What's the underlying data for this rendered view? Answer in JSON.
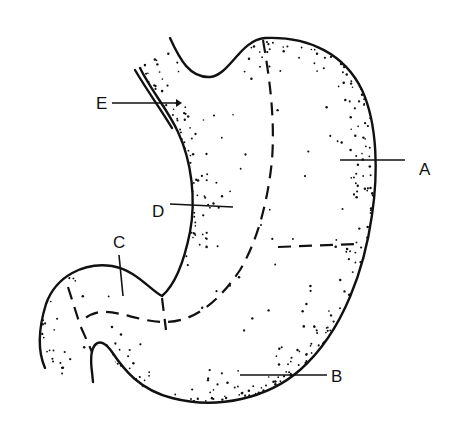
{
  "figure": {
    "labels": [
      {
        "id": "A",
        "text": "A",
        "x": 421,
        "y": 174,
        "lx1": 340,
        "ly1": 160,
        "lx2": 405,
        "ly2": 160
      },
      {
        "id": "B",
        "text": "B",
        "x": 332,
        "y": 382,
        "lx1": 240,
        "ly1": 375,
        "lx2": 327,
        "ly2": 375
      },
      {
        "id": "C",
        "text": "C",
        "x": 114,
        "y": 248,
        "lx1": 121,
        "ly1": 258,
        "lx2": 124,
        "ly2": 296
      },
      {
        "id": "D",
        "text": "D",
        "x": 153,
        "y": 217,
        "lx1": 168,
        "ly1": 203,
        "lx2": 232,
        "ly2": 206
      },
      {
        "id": "E",
        "text": "E",
        "x": 97,
        "y": 108,
        "lx1": 113,
        "ly1": 103,
        "lx2": 176,
        "ly2": 103
      }
    ]
  },
  "colors": {
    "ink": "#111111",
    "background": "#ffffff"
  }
}
